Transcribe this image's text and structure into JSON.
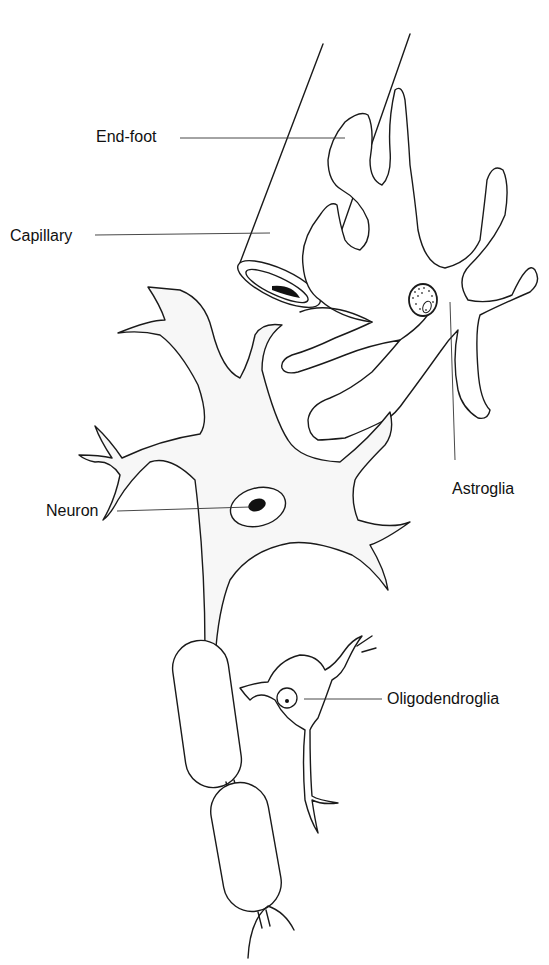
{
  "figure": {
    "type": "anatomical diagram"
  },
  "labels": {
    "end_foot": "End-foot",
    "capillary": "Capillary",
    "neuron": "Neuron",
    "astroglia": "Astroglia",
    "oligodendroglia": "Oligodendroglia"
  },
  "colors": {
    "line": "#1a1a1a",
    "background": "#ffffff",
    "cytoplasm": "#f7f7f7"
  }
}
